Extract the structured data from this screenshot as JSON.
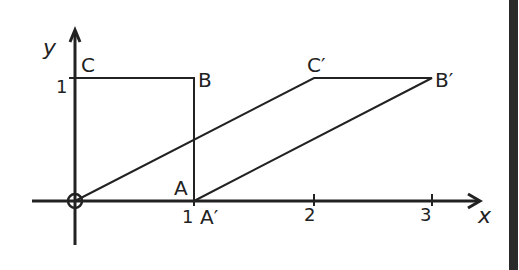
{
  "diagram": {
    "axes": {
      "x_label": "x",
      "y_label": "y",
      "x_ticks": [
        "1",
        "2",
        "3"
      ],
      "y_ticks": [
        "1"
      ]
    },
    "points": {
      "O": {
        "label": "",
        "coord": [
          0,
          0
        ]
      },
      "A": {
        "label": "A",
        "coord": [
          1,
          0
        ]
      },
      "B": {
        "label": "B",
        "coord": [
          1,
          1
        ]
      },
      "C": {
        "label": "C",
        "coord": [
          0,
          1
        ]
      },
      "A_prime": {
        "label": "A′",
        "coord": [
          1,
          0
        ]
      },
      "B_prime": {
        "label": "B′",
        "coord": [
          3,
          1
        ]
      },
      "C_prime": {
        "label": "C′",
        "coord": [
          2,
          1
        ]
      }
    },
    "shapes": [
      {
        "name": "unit-square",
        "vertices": [
          "O",
          "A",
          "B",
          "C"
        ]
      },
      {
        "name": "sheared-parallelogram",
        "vertices": [
          "O",
          "A_prime",
          "B_prime",
          "C_prime"
        ]
      }
    ],
    "colors": {
      "ink": "#222222",
      "background": "#ffffff"
    }
  }
}
